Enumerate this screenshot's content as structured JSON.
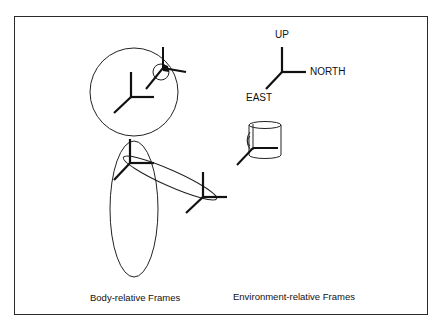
{
  "diagram": {
    "world_frame": {
      "axes": [
        {
          "label": "UP"
        },
        {
          "label": "NORTH"
        },
        {
          "label": "EAST"
        }
      ]
    },
    "captions": {
      "body": "Body-relative Frames",
      "environment": "Environment-relative Frames"
    },
    "elements": {
      "head": "head-circle",
      "eye": "eye-circle",
      "torso": "torso-ellipse",
      "arm": "arm-ellipse",
      "object": "mug"
    },
    "colors": {
      "stroke": "#111111",
      "background": "#ffffff",
      "border": "#2a2a2a"
    }
  }
}
